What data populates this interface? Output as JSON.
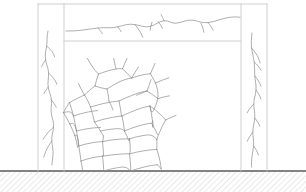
{
  "diagram": {
    "type": "structural-engineering-elevation",
    "background_color": "#ffffff",
    "canvas": {
      "width": 306,
      "height": 192
    },
    "line_colors": {
      "frame_outline": "#c9c9c9",
      "crack": "#8c8c8c",
      "ground_line": "#5a5a5a",
      "ground_hatch": "#b0b0b0"
    },
    "stroke_widths": {
      "frame_outline": 0.9,
      "crack": 0.7,
      "ground_line": 1.4,
      "ground_hatch": 0.55
    },
    "frame": {
      "label": "Reinforced concrete portal frame",
      "outer_left": 38,
      "outer_right": 267,
      "outer_top": 4,
      "base": 171,
      "left_column": {
        "label": "left-column",
        "x_outer": 38,
        "x_inner": 64,
        "y_top": 4,
        "y_bottom": 171
      },
      "right_column": {
        "label": "right-column",
        "x_outer": 241,
        "x_inner": 267,
        "y_top": 4,
        "y_bottom": 171
      },
      "top_beam": {
        "label": "top-beam",
        "x_left": 38,
        "x_right": 267,
        "y_top": 4,
        "y_bottom": 41
      },
      "infill_panel": {
        "label": "masonry-infill-panel",
        "x_left": 64,
        "x_right": 241,
        "y_top": 41,
        "y_bottom": 171
      }
    },
    "ground": {
      "label": "ground-line",
      "y": 171,
      "x_left": 0,
      "x_right": 306,
      "hatch": {
        "label": "ground-hatch",
        "angle_deg": 45,
        "spacing": 4,
        "depth": 21,
        "fill_top": 172,
        "fill_bottom": 192
      }
    },
    "cracks": {
      "beam_crack": {
        "label": "horizontal-crack-in-top-beam",
        "orientation": "horizontal",
        "path": "M 66 31 C 78 31.5 88 29 98 28 C 106 27.2 112 28.5 118 26.8 C 124 25.2 129 23.4 135 24.6 C 141 25.8 145 27.6 150 26.4 C 155 25.2 159 21.4 164 20.8 C 169 20.2 171 23.6 176 23.2 C 182 22.7 186 19.6 192 20.1 C 198 20.6 201 23.4 208 22.6 C 215 21.8 222 18.4 229 17.4 C 234 16.7 238 16.9 240 17.3",
        "branches": [
          "M 135 24.6 C 137 27.2 139 29.8 140.5 32.4 C 141.6 34.3 142.2 35.9 142.6 37.2",
          "M 152 22.2 C 151 25.2 150.4 27.8 150.2 30.2",
          "M 158 21.6 C 160 23.8 161.5 26.2 162.6 28.4",
          "M 164 20.8 C 163 18.4 162 16.2 161.2 14.6",
          "M 201 23.4 C 202.6 26.6 203.4 29.4 203.8 32.2",
          "M 208 22.6 C 210.4 25.4 212 27.8 213.2 30.2",
          "M 98 28 C 100 30.4 101.4 32.2 102.4 33.6",
          "M 118 26.8 C 119.2 28.6 120.2 30.2 121 31.6"
        ]
      },
      "left_column_crack": {
        "label": "vertical-crack-in-left-column",
        "orientation": "vertical",
        "path": "M 48 31 C 46.6 36 47.4 41 46.6 46 C 45.8 51 44.8 55 45.6 60 C 46.4 65 48.4 68 48.6 73 C 48.8 78 47.4 82 48.2 87 C 49 92 51 95 51.4 100 C 51.8 105 50.6 109 51.4 114 C 52.2 119 54 122 53.6 127 C 53.2 132 51.4 136 51.8 141 C 52.2 146 53.4 150 53 155 C 52.7 159 52.2 162 51.9 165",
        "branches": [
          "M 46.6 46 C 49 48 51 50 52.4 52 C 53.6 53.8 54.2 55.4 54.6 56.8",
          "M 48.6 73 C 51.2 75.4 53.2 77.6 54.6 79.8 C 55.8 81.6 56.4 83 56.8 84.2",
          "M 51.4 100 C 53.6 102.6 55.2 105 56.2 107.2",
          "M 53.6 127 C 50.4 129.8 48 132.4 46.2 134.8 C 44.8 136.6 43.8 138 43.2 139.2",
          "M 51.8 141 C 49.2 144.6 47.2 148 45.8 151.2 C 44.8 153.6 44.2 155.6 43.8 157.2",
          "M 45.6 60 C 43.8 62.4 42.4 64.6 41.6 66.4",
          "M 48.2 87 C 46.2 89.6 44.8 91.8 44 93.6"
        ]
      },
      "right_column_crack": {
        "label": "vertical-crack-in-right-column",
        "orientation": "vertical",
        "path": "M 252 33 C 251.4 38 251 43 251.6 48 C 252.2 53 253.6 57 254.2 62 C 254.8 67 254.4 71 254.8 76 C 255.2 81 256.4 85 256 90 C 255.6 95 253.8 99 253.8 104 C 253.8 109 255.2 113 254.8 118 C 254.4 123 252.8 127 252.8 132 C 252.8 137 254 141 253.6 146 C 253.2 151 251.8 155 251.6 160 C 251.5 163 251.5 165.4 251.6 167",
        "branches": [
          "M 251.6 48 C 254.6 51.4 256.8 54.6 258.2 57.6 C 259.2 59.8 259.8 61.6 260.1 63",
          "M 254.2 62 C 257.4 64.8 259.6 67.6 261 70.2",
          "M 254.8 76 C 257.8 79.6 259.8 83 261 86.2",
          "M 256 90 C 258.4 93.4 260 96.4 261 99",
          "M 253.8 104 C 250.8 107 248.6 110 247.2 112.8",
          "M 254.8 118 C 257.2 121 258.8 123.8 259.8 126.2",
          "M 252.8 132 C 250.2 135.4 248.4 138.6 247.2 141.4",
          "M 253.6 146 C 256 149.2 257.6 152.2 258.4 155"
        ]
      },
      "infill_crack_web": {
        "label": "diagonal-polygonal-crack-web-in-infill",
        "description": "Dense network of interconnected cracks forming polygonal cells, concentrated in the lower-left to mid region of the infill panel",
        "paths": [
          "M 92 66 C 94 69 96 72 98.5 74",
          "M 98.5 74 C 104 72 110 70 116 69 C 119 68.5 121 68.6 122.5 68.8",
          "M 122.5 68.8 C 126 72 129 75 131.5 78",
          "M 131.5 78 C 136 76.6 140 75.4 144 74.6 C 147 74 149 73.8 150.5 73.8",
          "M 150.5 73.8 C 152.5 77 154 80 155.5 83",
          "M 98.5 74 C 97 78 95.8 82 95 86",
          "M 95 86 C 99 87.4 103 88.4 107 89",
          "M 107 89 C 111 86.4 115 84 119 82 C 123 80 127 78.8 131.5 78",
          "M 95 86 C 91 89 87.4 92 84.5 95",
          "M 84.5 95 C 87 99 89 103 90.5 107",
          "M 90.5 107 C 96 105.4 101 104 106 103 C 111 102 115 101.4 119 101",
          "M 119 101 C 124 98.6 129 96.4 134 94.6 C 139 92.8 143 91.6 147 91",
          "M 147 91 C 151 93.6 155 96.2 158 98.6",
          "M 155.5 83 C 157 87 158 91 158 95 C 158 96.4 157.8 97.6 157.6 98.6",
          "M 147 91 C 148.6 87 150 83 151 79.6",
          "M 107 89 C 108 93 108.8 97 109 101",
          "M 84.5 95 C 79 97.4 74 100 69.5 102.6",
          "M 69.5 102.6 C 71 107 72.4 111.4 73.5 116",
          "M 73.5 116 C 78 114.4 83 113 88 112 C 92 111.2 95 110.8 97.5 110.6",
          "M 90.5 107 C 92 112 93.4 117 94.5 122",
          "M 94.5 122 C 99 120.4 104 119 109 118 C 114 117 118 116.4 122 116",
          "M 119 101 C 120 106 121 111 121.5 116",
          "M 122 116 C 127 113.6 132 111.4 137 109.6 C 142 107.8 146 106.6 150 106",
          "M 158 98.6 C 157 102.4 155.6 106 154 109.4 C 152.6 112.4 151.2 114.8 150 106",
          "M 150 106 C 154 109 158 112 161 115 C 163 117 164.4 118.6 165.5 120",
          "M 73.5 116 C 74.6 121 75.6 126 76.5 131",
          "M 76.5 131 C 81 129.8 86 128.8 91 128.2 C 95 127.7 98 127.5 100.5 127.4",
          "M 94.5 122 C 96.5 125 98.6 128 100.5 131 C 101.8 133 102.8 134.6 103.5 136",
          "M 122 116 C 123 121 124 126 124.5 131",
          "M 124.5 131 C 129 129 134 127.2 139 125.8 C 144 124.4 148 123.6 151.5 123.2",
          "M 150 106 C 151 111 152 116 152.5 121 C 152.8 123.8 152.8 125.8 152.8 127",
          "M 165.5 120 C 163.4 124 161.4 128 159.8 131.8 C 158.4 135 157.4 137.6 156.8 139.6",
          "M 151.5 123.2 C 154 127 156 131 157.5 134.6",
          "M 76.5 131 C 77.4 136 78.2 141 78.8 146",
          "M 78.8 146 C 83 144.6 88 143.4 93 142.6 C 97 142 100 141.7 102.5 141.6",
          "M 103.5 136 C 103 140 102.8 144 102.5 141.6",
          "M 100.5 131 C 105 130 110 129.2 115 128.8 C 119 128.5 122 128.4 124.5 131",
          "M 102.5 141.6 C 107 140.6 112 139.8 117 139.4 C 122 139 126 138.8 129.5 138.8",
          "M 124.5 131 C 126 134 127.4 137 128.6 140 C 129.2 141.4 129.6 142.4 129.5 138.8",
          "M 129.5 138.8 C 134 137.4 139 136.2 144 135.4 C 149 134.6 153 134.2 156.8 139.6",
          "M 78.8 146 C 79.6 151 80.4 156 81 161",
          "M 81 161 C 85 159.6 89 158.4 93 157.6 C 97 156.8 100 156.4 102.5 156.2",
          "M 102.5 141.6 C 103 146 103.4 151 103.6 156 C 103.6 156 103.2 156.2 102.5 156.2",
          "M 102.5 156.2 C 107 155.4 112 154.8 117 154.4 C 122 154 126 153.8 129.5 153.8",
          "M 129.5 138.8 C 130 143 130.4 147 130.2 151 C 130.1 152.8 129.8 153.4 129.5 153.8",
          "M 129.5 153.8 C 134 152.6 139 151.6 144 150.8 C 149 150 153 149.6 156.8 149.4",
          "M 156.8 139.6 C 157 143 157 146.4 156.8 149.4",
          "M 81 161 C 81.6 164 82.2 167 82.6 170",
          "M 102.5 156.2 C 103 160 103.4 164 103.6 168 C 103.7 169.4 103.7 170.4 103.6 171",
          "M 129.5 153.8 C 130 158 130.4 162 130.6 166 C 130.7 168.4 130.7 170 130.6 171",
          "M 156.8 149.4 C 158 153 159.2 157 160 161 C 160.6 164.2 161 167 161.2 169",
          "M 103.6 171 C 108 169.6 113 168.4 118 167.6 C 123 166.8 127 166.4 130.6 171",
          "M 130.6 171 C 135 169.4 140 168 145 166.8 C 150 165.6 154 165 157.5 164.8",
          "M 161.2 169 C 160 167.4 158.6 166 157.5 164.8",
          "M 69.5 102.6 C 67 106 65 109.4 63.5 112.6",
          "M 63.5 112.6 C 65.8 116.4 68 120.2 69.8 124",
          "M 69.8 124 C 71.6 127.8 73.4 131.6 74.8 135.4",
          "M 74.8 135.4 C 76 139.4 77 143.4 77.6 147.4",
          "M 63.5 112.6 C 68 111.4 72 110.6 73.5 116",
          "M 69.8 124 C 72.4 123 74.8 122.2 76.5 131",
          "M 74.8 135.4 C 76.4 134.6 77.8 134 78.8 146",
          "M 155.5 83 C 160 81 164.6 79.2 168.8 77.8",
          "M 150.5 73.8 C 152 70 153.6 66.4 155 63.4",
          "M 158 98.6 C 162 97.4 166 96.4 169.5 95.8",
          "M 165.5 120 C 169.4 118.2 173 116.6 176 115.4",
          "M 92 66 C 90 63 88.4 60.4 87.4 58.4",
          "M 122.5 68.8 C 124 65 125.6 61.4 127 58.4",
          "M 116 69 C 115 65 114.2 61.4 113.8 58.4",
          "M 131.5 78 C 134 74 136.4 70.2 138.4 67",
          "M 84.5 95 C 82 91 80 87 78.5 83.4",
          "M 109 101 C 110.6 104 112 107 113 110",
          "M 147 91 C 143 92.6 139.4 94 136.5 95.2",
          "M 152.8 127 C 153 123 152.8 119 152.5 121"
        ]
      }
    }
  }
}
